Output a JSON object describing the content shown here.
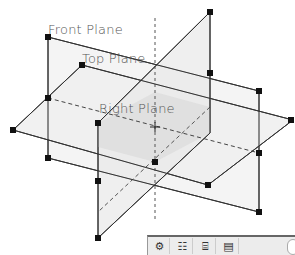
{
  "labels": {
    "front_plane": "Front Plane",
    "top_plane": "Top Plane",
    "right_plane": "Right Plane"
  },
  "toolbar": {
    "buttons": [
      {
        "name": "feature-manager-icon",
        "glyph": "⚙"
      },
      {
        "name": "property-manager-icon",
        "glyph": "☷"
      },
      {
        "name": "configuration-manager-icon",
        "glyph": "⌸"
      },
      {
        "name": "display-manager-icon",
        "glyph": "▤"
      }
    ]
  },
  "colors": {
    "edge": "#333333",
    "handle": "#111111",
    "plane_fill": "#efefef",
    "overlap_fill": "#dcdcdc"
  }
}
